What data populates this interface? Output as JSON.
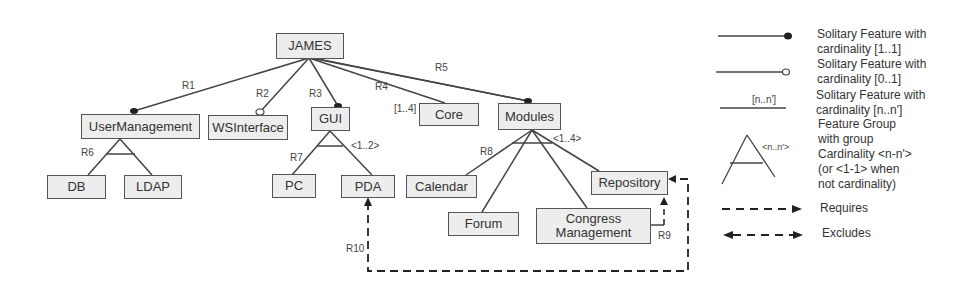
{
  "diagram": {
    "type": "feature-model",
    "root": "JAMES",
    "features": [
      {
        "id": "james",
        "label": "JAMES"
      },
      {
        "id": "usermanagement",
        "label": "UserManagement"
      },
      {
        "id": "wsinterface",
        "label": "WSInterface"
      },
      {
        "id": "gui",
        "label": "GUI"
      },
      {
        "id": "core",
        "label": "Core"
      },
      {
        "id": "modules",
        "label": "Modules"
      },
      {
        "id": "db",
        "label": "DB"
      },
      {
        "id": "ldap",
        "label": "LDAP"
      },
      {
        "id": "pc",
        "label": "PC"
      },
      {
        "id": "pda",
        "label": "PDA"
      },
      {
        "id": "calendar",
        "label": "Calendar"
      },
      {
        "id": "forum",
        "label": "Forum"
      },
      {
        "id": "congress",
        "label_line1": "Congress",
        "label_line2": "Management"
      },
      {
        "id": "repository",
        "label": "Repository"
      }
    ],
    "relations": [
      {
        "label": "R1",
        "from": "JAMES",
        "to": "UserManagement",
        "kind": "solitary [1..1]"
      },
      {
        "label": "R2",
        "from": "JAMES",
        "to": "WSInterface",
        "kind": "solitary [0..1]"
      },
      {
        "label": "R3",
        "from": "JAMES",
        "to": "GUI",
        "kind": "solitary [1..1]"
      },
      {
        "label": "R4",
        "from": "JAMES",
        "to": "Core",
        "kind": "solitary",
        "cardinality": "[1..4]"
      },
      {
        "label": "R5",
        "from": "JAMES",
        "to": "Modules",
        "kind": "solitary [1..1]"
      },
      {
        "label": "R6",
        "from": "UserManagement",
        "to": [
          "DB",
          "LDAP"
        ],
        "kind": "group"
      },
      {
        "label": "R7",
        "from": "GUI",
        "to": [
          "PC",
          "PDA"
        ],
        "kind": "group",
        "cardinality": "<1..2>"
      },
      {
        "label": "R8",
        "from": "Modules",
        "to": [
          "Calendar",
          "Forum",
          "Congress Management",
          "Repository"
        ],
        "kind": "group",
        "cardinality": "<1..4>"
      },
      {
        "label": "R9",
        "from": "Congress Management",
        "to": "Repository",
        "kind": "requires"
      },
      {
        "label": "R10",
        "from": "Repository",
        "to": "PDA",
        "kind": "excludes"
      }
    ],
    "labels": {
      "r1": "R1",
      "r2": "R2",
      "r3": "R3",
      "r4": "R4",
      "r5": "R5",
      "r6": "R6",
      "r7": "R7",
      "r8": "R8",
      "r9": "R9",
      "r10": "R10",
      "core_card": "[1..4]",
      "gui_card": "<1..2>",
      "modules_card": "<1..4>"
    }
  },
  "legend": {
    "items": [
      {
        "symbol": "line-filled-circle",
        "line1": "Solitary Feature with",
        "line2": "cardinality [1..1]"
      },
      {
        "symbol": "line-open-circle",
        "line1": "Solitary Feature with",
        "line2": "cardinality [0..1]"
      },
      {
        "symbol": "line-with-label",
        "symbol_label": "[n..n']",
        "line1": "Solitary Feature with",
        "line2": "cardinality [n..n']"
      },
      {
        "symbol": "group-triangle",
        "symbol_label": "<n..n'>",
        "line1": "Feature Group",
        "line2": "with group",
        "line3": "Cardinality <n-n'>",
        "line4": "(or <1-1> when",
        "line5": "not cardinality)"
      },
      {
        "symbol": "dashed-arrow",
        "line1": "Requires"
      },
      {
        "symbol": "dashed-double-arrow",
        "line1": "Excludes"
      }
    ]
  },
  "colors": {
    "box_fill": "#ededed",
    "stroke": "#444444",
    "legend_fill": "#f1f1f1"
  }
}
